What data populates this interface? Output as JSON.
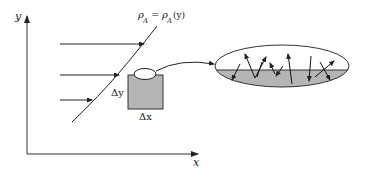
{
  "diagram": {
    "type": "mass-transfer-concentration-profile",
    "axes": {
      "x_label": "x",
      "y_label": "y"
    },
    "curve_label": {
      "lhs_symbol": "ρ",
      "lhs_sub": "A",
      "equals": "=",
      "rhs_symbol": "ρ",
      "rhs_sub": "A",
      "rhs_arg": "(y)"
    },
    "flow_arrows_count": 3,
    "element": {
      "dy_label": "Δy",
      "dx_label": "Δx"
    },
    "magnified_view": {
      "description": "Enlarged surface element showing molecules crossing interface (random walk arrows)",
      "random_arrow_count": 10
    },
    "colors": {
      "line": "#222222",
      "fill_gray": "#b5b5b5",
      "background": "#ffffff"
    }
  }
}
